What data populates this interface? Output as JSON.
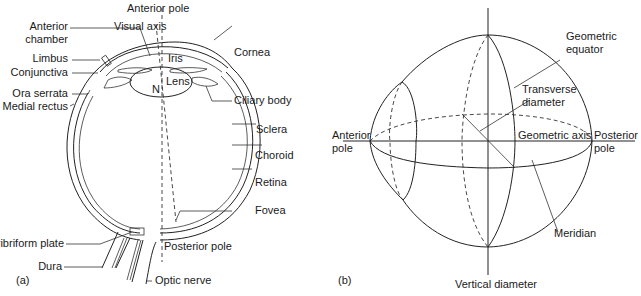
{
  "panel_a": {
    "caption": "(a)",
    "labels": {
      "anterior_pole": "Anterior pole",
      "visual_axis": "Visual axis",
      "anterior_chamber_1": "Anterior",
      "anterior_chamber_2": "chamber",
      "limbus": "Limbus",
      "conjunctiva": "Conjunctiva",
      "ora_serrata": "Ora serrata",
      "medial_rectus": "Medial rectus",
      "iris": "Iris",
      "lens": "Lens",
      "nodal_point": "N",
      "cornea": "Cornea",
      "ciliary_body": "Ciliary body",
      "sclera": "Sclera",
      "choroid": "Choroid",
      "retina": "Retina",
      "fovea": "Fovea",
      "posterior_pole": "Posterior pole",
      "cribriform_plate": "Cribriform plate",
      "dura": "Dura",
      "optic_nerve": "Optic nerve"
    }
  },
  "panel_b": {
    "caption": "(b)",
    "labels": {
      "geometric_equator_1": "Geometric",
      "geometric_equator_2": "equator",
      "transverse_diameter_1": "Transverse",
      "transverse_diameter_2": "diameter",
      "anterior_pole_1": "Anterior",
      "anterior_pole_2": "pole",
      "geometric_axis": "Geometric axis",
      "posterior_pole_1": "Posterior",
      "posterior_pole_2": "pole",
      "meridian": "Meridian",
      "vertical_diameter": "Vertical diameter"
    }
  }
}
